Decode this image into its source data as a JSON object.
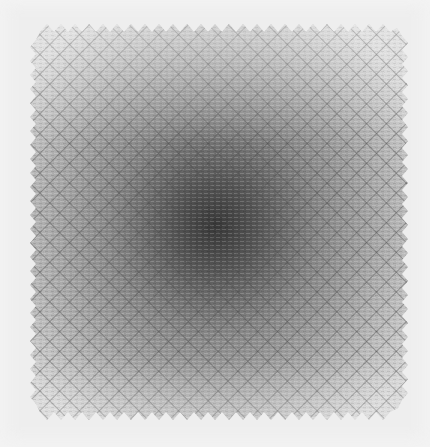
{
  "image": {
    "description": "Grayscale photograph of a square textured mesh/fabric with a diamond lattice pattern, darkest at the center and fading toward the edges, zigzag borders",
    "width": 430,
    "height": 447,
    "colors": {
      "background": "#f3f3f3",
      "center_dark": "#3a3a3a",
      "mid_gray": "#8c8c8c",
      "edge_light": "#d6d6d6",
      "lattice_line": "#6e6e6e"
    },
    "pattern": {
      "type": "diamond-lattice",
      "cell_pitch_px": 14
    },
    "dark_center": {
      "x": 215,
      "y": 225
    }
  }
}
